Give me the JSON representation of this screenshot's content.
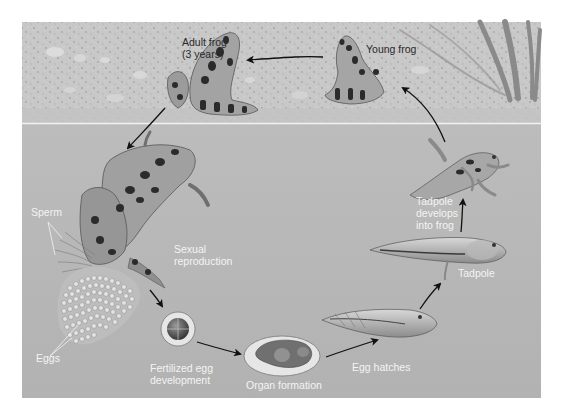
{
  "diagram": {
    "colors": {
      "background": "#ffffff",
      "land": "#c9c9c9",
      "water": "#b7b7b7",
      "waterline": "#eeeeee",
      "frog_body": "#9a9a9a",
      "frog_spots": "#2b2b2b",
      "arrow": "#111111",
      "label_dark": "#2a2a2a",
      "label_light": "#f4f4f4"
    },
    "stages": [
      {
        "id": "adult-frog",
        "label": "Adult frog\n(3 years)"
      },
      {
        "id": "young-frog",
        "label": "Young frog"
      },
      {
        "id": "sexual-reproduction",
        "label": "Sexual\nreproduction"
      },
      {
        "id": "fertilized-egg",
        "label": "Fertilized egg\ndevelopment"
      },
      {
        "id": "organ-formation",
        "label": "Organ formation"
      },
      {
        "id": "egg-hatches",
        "label": "Egg hatches"
      },
      {
        "id": "tadpole",
        "label": "Tadpole"
      },
      {
        "id": "tadpole-develops",
        "label": "Tadpole\ndevelops\ninto frog"
      }
    ],
    "callouts": [
      {
        "id": "sperm",
        "label": "Sperm"
      },
      {
        "id": "eggs",
        "label": "Eggs"
      }
    ]
  }
}
